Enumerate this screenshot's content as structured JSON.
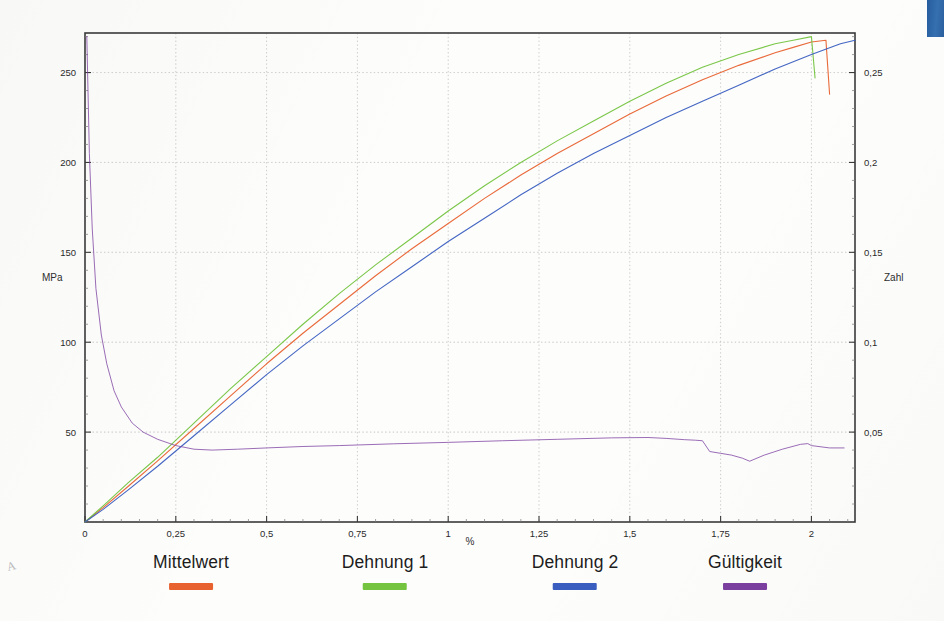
{
  "document": {
    "kind": "scanned-chart-page",
    "corner_mark": "A"
  },
  "corner_tab": {
    "name": "page-tab",
    "color": "#2c66a8"
  },
  "chart_data": {
    "type": "line",
    "title": "",
    "subtitle": "",
    "xlabel": "%",
    "ylabel": "MPa",
    "y2label": "Zahl",
    "xlim": [
      0,
      2.12
    ],
    "ylim": [
      0,
      272
    ],
    "y2lim": [
      0,
      0.272
    ],
    "grid": true,
    "legend_position": "bottom",
    "xticks": [
      "0",
      "0,25",
      "0,5",
      "0,75",
      "1",
      "1,25",
      "1,5",
      "1,75",
      "2"
    ],
    "xtick_values": [
      0,
      0.25,
      0.5,
      0.75,
      1,
      1.25,
      1.5,
      1.75,
      2
    ],
    "yticks": [
      "50",
      "100",
      "150",
      "200",
      "250"
    ],
    "ytick_values": [
      50,
      100,
      150,
      200,
      250
    ],
    "y2ticks": [
      "0,05",
      "0,1",
      "0,15",
      "0,2",
      "0,25"
    ],
    "y2tick_values": [
      0.05,
      0.1,
      0.15,
      0.2,
      0.25
    ],
    "series": [
      {
        "name": "Mittelwert",
        "color": "#e8622f",
        "axis": "left",
        "x": [
          0,
          0.05,
          0.12,
          0.2,
          0.3,
          0.4,
          0.5,
          0.6,
          0.7,
          0.8,
          0.9,
          1.0,
          1.1,
          1.2,
          1.3,
          1.4,
          1.5,
          1.6,
          1.7,
          1.8,
          1.9,
          1.95,
          2.0,
          2.04,
          2.05
        ],
        "y": [
          0,
          8,
          20,
          34,
          52,
          70,
          88,
          105,
          121,
          137,
          152,
          166,
          180,
          193,
          205,
          216,
          227,
          237,
          246,
          254,
          261,
          264,
          267,
          268,
          238
        ]
      },
      {
        "name": "Dehnung 1",
        "color": "#74c43f",
        "axis": "left",
        "x": [
          0,
          0.05,
          0.12,
          0.2,
          0.3,
          0.4,
          0.5,
          0.6,
          0.7,
          0.8,
          0.9,
          1.0,
          1.1,
          1.2,
          1.3,
          1.4,
          1.5,
          1.6,
          1.7,
          1.8,
          1.9,
          1.95,
          2.0,
          2.01
        ],
        "y": [
          0,
          9,
          22,
          36,
          55,
          74,
          92,
          110,
          127,
          143,
          158,
          173,
          187,
          200,
          212,
          223,
          234,
          244,
          253,
          260,
          266,
          268,
          270,
          247
        ]
      },
      {
        "name": "Dehnung 2",
        "color": "#3a5ec0",
        "axis": "left",
        "x": [
          0,
          0.05,
          0.12,
          0.2,
          0.3,
          0.4,
          0.5,
          0.6,
          0.7,
          0.8,
          0.9,
          1.0,
          1.1,
          1.2,
          1.3,
          1.4,
          1.5,
          1.6,
          1.7,
          1.8,
          1.9,
          2.0,
          2.08,
          2.12
        ],
        "y": [
          0,
          7,
          18,
          31,
          48,
          65,
          82,
          98,
          113,
          128,
          142,
          156,
          169,
          182,
          194,
          205,
          215,
          225,
          234,
          243,
          252,
          260,
          266,
          268
        ]
      },
      {
        "name": "Gültigkeit",
        "color": "#7b3fa0",
        "axis": "right",
        "x": [
          0.005,
          0.012,
          0.02,
          0.03,
          0.045,
          0.06,
          0.08,
          0.1,
          0.13,
          0.16,
          0.2,
          0.25,
          0.3,
          0.35,
          0.42,
          0.5,
          0.6,
          0.7,
          0.85,
          1.0,
          1.15,
          1.3,
          1.45,
          1.55,
          1.6,
          1.65,
          1.68,
          1.7,
          1.72,
          1.75,
          1.78,
          1.81,
          1.83,
          1.87,
          1.92,
          1.97,
          1.99,
          2.0,
          2.05,
          2.09
        ],
        "y": [
          0.27,
          0.205,
          0.163,
          0.13,
          0.104,
          0.088,
          0.073,
          0.064,
          0.055,
          0.05,
          0.046,
          0.0425,
          0.0405,
          0.04,
          0.0405,
          0.0412,
          0.042,
          0.0425,
          0.0435,
          0.0443,
          0.0452,
          0.046,
          0.0468,
          0.047,
          0.0465,
          0.0458,
          0.0455,
          0.0452,
          0.0392,
          0.0382,
          0.0372,
          0.0355,
          0.0338,
          0.0372,
          0.0405,
          0.0432,
          0.0436,
          0.0425,
          0.0412,
          0.0412
        ]
      }
    ]
  },
  "legend": {
    "entries": [
      {
        "label": "Mittelwert",
        "color": "#e8622f"
      },
      {
        "label": "Dehnung 1",
        "color": "#74c43f"
      },
      {
        "label": "Dehnung 2",
        "color": "#3a5ec0"
      },
      {
        "label": "Gültigkeit",
        "color": "#7b3fa0"
      }
    ]
  }
}
